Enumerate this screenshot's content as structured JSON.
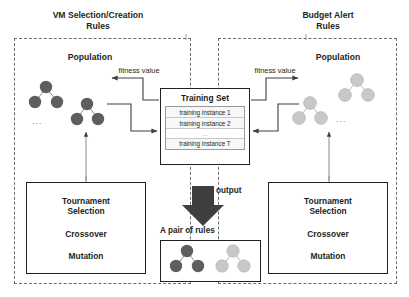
{
  "diagram": {
    "title_left": "VM Selection/Creation\nRules",
    "title_right": "Budget Alert\nRules",
    "population_label_left": "Population",
    "population_label_right": "Population",
    "fitness_label_left": "fitness value",
    "fitness_label_right": "fitness value",
    "ellipsis_left": "...",
    "ellipsis_right": "...",
    "output_label": "output",
    "pair_label": "A pair of rules"
  },
  "training_set": {
    "title": "Training Set",
    "rows": [
      "training instance 1",
      "training instance 2",
      "...",
      "training instance T"
    ]
  },
  "operators_left": {
    "selection": "Tournament\nSelection",
    "crossover": "Crossover",
    "mutation": "Mutation"
  },
  "operators_right": {
    "selection": "Tournament\nSelection",
    "crossover": "Crossover",
    "mutation": "Mutation"
  },
  "colors": {
    "dark_node": "#5e5e5e",
    "light_node": "#c8c8c8",
    "outline": "#231f20",
    "dashed_border": "#6b6b6b",
    "arrow_fill": "#3f3f3f"
  }
}
